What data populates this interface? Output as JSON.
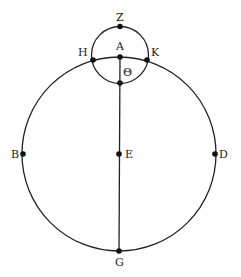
{
  "diagram": {
    "colors": {
      "stroke": "#222222",
      "background": "#ffffff"
    },
    "circles": [
      {
        "name": "main-circle",
        "cx": 119,
        "cy": 154,
        "r": 97
      },
      {
        "name": "small-circle",
        "cx": 120,
        "cy": 55,
        "r": 28.5
      }
    ],
    "lines": [
      {
        "name": "line-A-G",
        "from": "A",
        "to": "G"
      }
    ],
    "points": [
      {
        "label": "Z",
        "x": 120,
        "y": 26.5
      },
      {
        "label": "H",
        "x": 93,
        "y": 60
      },
      {
        "label": "A",
        "x": 120,
        "y": 57
      },
      {
        "label": "K",
        "x": 147,
        "y": 60
      },
      {
        "label": "Θ",
        "x": 120,
        "y": 83
      },
      {
        "label": "B",
        "x": 23,
        "y": 154
      },
      {
        "label": "E",
        "x": 119,
        "y": 154
      },
      {
        "label": "D",
        "x": 215,
        "y": 154
      },
      {
        "label": "G",
        "x": 119,
        "y": 251
      }
    ]
  }
}
